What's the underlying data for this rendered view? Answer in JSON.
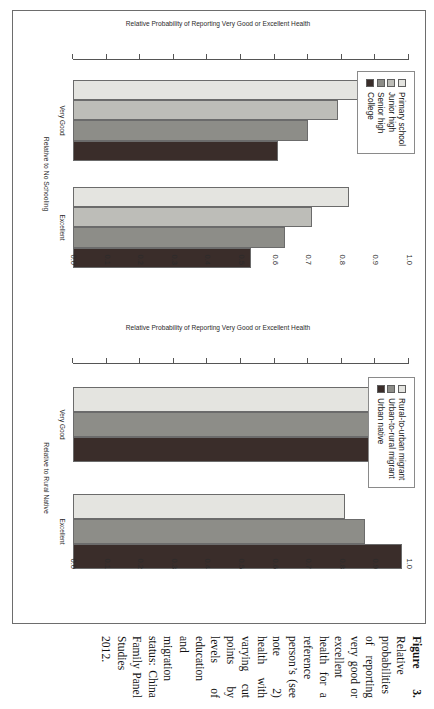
{
  "caption": {
    "figure_number": "Figure 3.",
    "text": " Relative probabilities of reporting very good or excellent health for a reference person’s (see note 2) health with varying cut points by levels of education and migration status: China Family Panel Studies 2012."
  },
  "axis": {
    "ylabel": "Relative Probability of Reporting Very Good or Excellent Health",
    "yticks": [
      "1.0",
      "0.9",
      "0.8",
      "0.7",
      "0.6",
      "0.5",
      "0.4",
      "0.3",
      "0.2",
      "0.1",
      "0.0"
    ],
    "ymin": 0.0,
    "ymax": 1.0
  },
  "colors": {
    "level1": "#e4e4e0",
    "level2": "#bdbdb8",
    "level3": "#8d8d88",
    "level4": "#3a2d2a",
    "axis": "#555555",
    "border": "#6b6b6b",
    "frame": "#6d6d6d"
  },
  "chart_data": [
    {
      "type": "bar",
      "panel": "education",
      "title": "",
      "xlabel": "Relative to No Schooling",
      "ylabel": "Relative Probability of Reporting Very Good or Excellent Health",
      "ylim": [
        0.0,
        1.0
      ],
      "grid": false,
      "legend_position": "top-left",
      "categories": [
        "Very Good",
        "Excellent"
      ],
      "series": [
        {
          "name": "Primary school",
          "color": "#e4e4e0",
          "values": [
            0.85,
            0.82
          ]
        },
        {
          "name": "Junior high",
          "color": "#bdbdb8",
          "values": [
            0.79,
            0.71
          ]
        },
        {
          "name": "Senior high",
          "color": "#8d8d88",
          "values": [
            0.7,
            0.63
          ]
        },
        {
          "name": "College",
          "color": "#3a2d2a",
          "values": [
            0.61,
            0.53
          ]
        }
      ]
    },
    {
      "type": "bar",
      "panel": "migration",
      "title": "",
      "xlabel": "Relative to Rural Native",
      "ylabel": "Relative Probability of Reporting Very Good or Excellent Health",
      "ylim": [
        0.0,
        1.0
      ],
      "grid": false,
      "legend_position": "top-left",
      "categories": [
        "Very Good",
        "Excellent"
      ],
      "series": [
        {
          "name": "Rural-to-urban migrant",
          "color": "#e4e4e0",
          "values": [
            0.97,
            0.81
          ]
        },
        {
          "name": "Urban-to-rural migrant",
          "color": "#8d8d88",
          "values": [
            0.98,
            0.87
          ]
        },
        {
          "name": "Urban native",
          "color": "#3a2d2a",
          "values": [
            0.99,
            0.98
          ]
        }
      ]
    }
  ]
}
